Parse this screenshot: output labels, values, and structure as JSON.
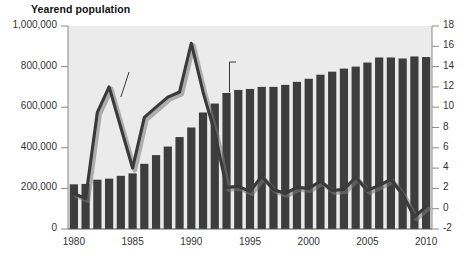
{
  "chart_data": {
    "type": "bar",
    "title": "",
    "axis_title_left": "Yearend population",
    "xlabel": "",
    "ylabel": "Yearend population",
    "ylabel_right": "Annual percent change",
    "grid": false,
    "legend_position": "inline-annotations",
    "ylim": [
      0,
      1000000
    ],
    "ylim_right": [
      -2,
      18
    ],
    "xlim": [
      1979.5,
      2010.5
    ],
    "y_ticks_left": [
      "0",
      "200,000",
      "400,000",
      "600,000",
      "800,000",
      "1,000,000"
    ],
    "y_tick_values_left": [
      0,
      200000,
      400000,
      600000,
      800000,
      1000000
    ],
    "y_ticks_right": [
      "-2",
      "0",
      "2",
      "4",
      "6",
      "8",
      "10",
      "12",
      "14",
      "16",
      "18"
    ],
    "y_tick_values_right": [
      -2,
      0,
      2,
      4,
      6,
      8,
      10,
      12,
      14,
      16,
      18
    ],
    "x_ticks": [
      "1980",
      "1985",
      "1990",
      "1995",
      "2000",
      "2005",
      "2010"
    ],
    "x_tick_values": [
      1980,
      1985,
      1990,
      1995,
      2000,
      2005,
      2010
    ],
    "categories": [
      1980,
      1981,
      1982,
      1983,
      1984,
      1985,
      1986,
      1987,
      1988,
      1989,
      1990,
      1991,
      1992,
      1993,
      1994,
      1995,
      1996,
      1997,
      1998,
      1999,
      2000,
      2001,
      2002,
      2003,
      2004,
      2005,
      2006,
      2007,
      2008,
      2009,
      2010
    ],
    "annotations": [
      {
        "text": "Annual percent change",
        "target_year": 1984,
        "target_value": 11.0
      },
      {
        "text": "Yearend population",
        "target_year": 1993,
        "target_value": 670000
      }
    ],
    "series": [
      {
        "name": "Yearend population",
        "type": "bar",
        "axis": "left",
        "color": "#3d3d3d",
        "values": [
          220000,
          222000,
          243000,
          248000,
          262000,
          274000,
          321000,
          364000,
          406000,
          453000,
          500000,
          574000,
          618000,
          670000,
          685000,
          690000,
          700000,
          700000,
          710000,
          725000,
          740000,
          760000,
          775000,
          790000,
          800000,
          820000,
          845000,
          845000,
          840000,
          850000,
          847000
        ]
      },
      {
        "name": "Annual percent change",
        "type": "line",
        "axis": "right",
        "color": "#3a3a3a",
        "values": [
          1.5,
          1.0,
          9.5,
          12.0,
          8.0,
          4.0,
          9.0,
          10.0,
          11.0,
          11.5,
          16.3,
          11.5,
          7.5,
          2.1,
          2.2,
          1.7,
          3.2,
          1.9,
          1.5,
          2.1,
          2.0,
          2.7,
          1.8,
          1.9,
          3.1,
          1.8,
          2.3,
          2.9,
          1.4,
          -0.8,
          0.2
        ]
      }
    ]
  }
}
